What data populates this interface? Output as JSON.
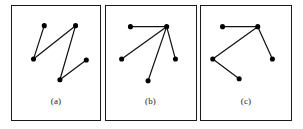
{
  "figure": {
    "background_color": "#ffffff",
    "border_color": "#1a1a1a",
    "node_color": "#000000",
    "edge_color": "#111111",
    "panel_count": 3
  },
  "panels": [
    {
      "id": "panel-a",
      "label": "(a)",
      "graph_type": "path",
      "node_count": 5,
      "edge_count": 4,
      "nodes": [
        {
          "id": "a1",
          "x": 33,
          "y": 20
        },
        {
          "id": "a2",
          "x": 22,
          "y": 54
        },
        {
          "id": "a3",
          "x": 65,
          "y": 20
        },
        {
          "id": "a4",
          "x": 49,
          "y": 75
        },
        {
          "id": "a5",
          "x": 76,
          "y": 55
        }
      ],
      "edges": [
        {
          "from": "a1",
          "to": "a2"
        },
        {
          "from": "a2",
          "to": "a3"
        },
        {
          "from": "a3",
          "to": "a4"
        },
        {
          "from": "a4",
          "to": "a5"
        }
      ]
    },
    {
      "id": "panel-b",
      "label": "(b)",
      "graph_type": "star",
      "node_count": 5,
      "edge_count": 4,
      "hub": "b3",
      "nodes": [
        {
          "id": "b1",
          "x": 25,
          "y": 21
        },
        {
          "id": "b2",
          "x": 16,
          "y": 54
        },
        {
          "id": "b3",
          "x": 62,
          "y": 21
        },
        {
          "id": "b4",
          "x": 43,
          "y": 76
        },
        {
          "id": "b5",
          "x": 71,
          "y": 54
        }
      ],
      "edges": [
        {
          "from": "b1",
          "to": "b3"
        },
        {
          "from": "b2",
          "to": "b3"
        },
        {
          "from": "b4",
          "to": "b3"
        },
        {
          "from": "b5",
          "to": "b3"
        }
      ]
    },
    {
      "id": "panel-c",
      "label": "(c)",
      "graph_type": "path",
      "node_count": 5,
      "edge_count": 4,
      "nodes": [
        {
          "id": "c1",
          "x": 22,
          "y": 21
        },
        {
          "id": "c2",
          "x": 58,
          "y": 21
        },
        {
          "id": "c3",
          "x": 12,
          "y": 54
        },
        {
          "id": "c4",
          "x": 73,
          "y": 54
        },
        {
          "id": "c5",
          "x": 39,
          "y": 74
        }
      ],
      "edges": [
        {
          "from": "c1",
          "to": "c2"
        },
        {
          "from": "c2",
          "to": "c3"
        },
        {
          "from": "c2",
          "to": "c4"
        },
        {
          "from": "c3",
          "to": "c5"
        }
      ]
    }
  ]
}
